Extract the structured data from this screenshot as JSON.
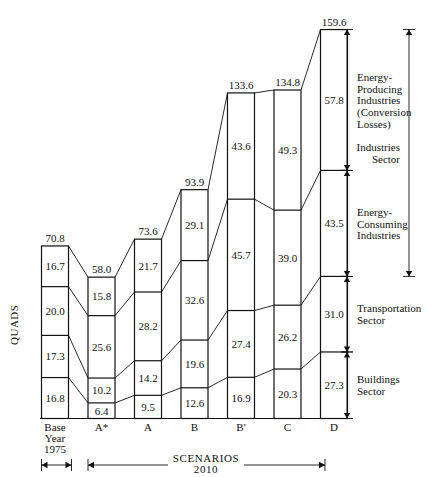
{
  "chart_data": {
    "type": "bar",
    "title": "",
    "subtitle": "",
    "xlabel": "",
    "ylabel": "QUADS",
    "grid": false,
    "stacked": true,
    "ylim": [
      0,
      159.6
    ],
    "categories": [
      "Base Year 1975",
      "A*",
      "A",
      "B",
      "B'",
      "C",
      "D"
    ],
    "category_labels": [
      {
        "line1": "Base",
        "line2": "Year",
        "line3": "1975"
      },
      {
        "line1": "A*",
        "line2": "",
        "line3": ""
      },
      {
        "line1": "A",
        "line2": "",
        "line3": ""
      },
      {
        "line1": "B",
        "line2": "",
        "line3": ""
      },
      {
        "line1": "B'",
        "line2": "",
        "line3": ""
      },
      {
        "line1": "C",
        "line2": "",
        "line3": ""
      },
      {
        "line1": "D",
        "line2": "",
        "line3": ""
      }
    ],
    "series": [
      {
        "name": "Buildings Sector",
        "values": [
          16.8,
          6.4,
          9.5,
          12.6,
          16.9,
          20.3,
          27.3
        ]
      },
      {
        "name": "Transportation Sector",
        "values": [
          17.3,
          10.2,
          14.2,
          19.6,
          27.4,
          26.2,
          31.0
        ]
      },
      {
        "name": "Energy-Consuming Industries",
        "values": [
          20.0,
          25.6,
          28.2,
          32.6,
          45.7,
          39.0,
          43.5
        ]
      },
      {
        "name": "Energy-Producing Industries (Conversion Losses)",
        "values": [
          16.7,
          15.8,
          21.7,
          29.1,
          43.6,
          49.3,
          57.8
        ]
      }
    ],
    "totals": [
      70.8,
      58.0,
      73.6,
      93.9,
      133.6,
      134.8,
      159.6
    ],
    "legend_position": "right-annotations",
    "annotations": {
      "brackets": [
        {
          "label_lines": [
            "Energy-",
            "Producing",
            "Industries",
            "(Conversion",
            "Losses)"
          ]
        },
        {
          "label_lines": [
            "Energy-",
            "Consuming",
            "Industries"
          ]
        },
        {
          "label_lines": [
            "Transportation",
            "Sector"
          ]
        },
        {
          "label_lines": [
            "Buildings",
            "Sector"
          ]
        }
      ],
      "outer_bracket": {
        "label_lines": [
          "Industries",
          "Sector"
        ]
      },
      "scenarios_label": {
        "line1": "SCENARIOS",
        "line2": "2010"
      },
      "base_year_span": "1975"
    },
    "colors": {
      "stroke": "#111111",
      "fill": "#ffffff",
      "background": "#ffffff"
    }
  }
}
